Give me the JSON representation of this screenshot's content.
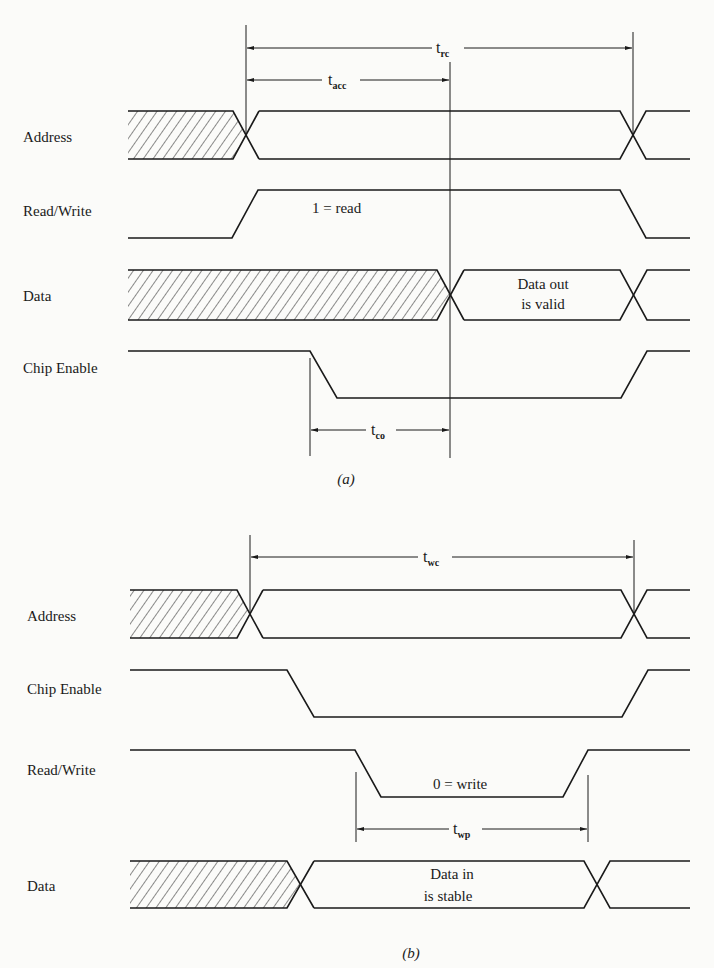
{
  "figure": {
    "part_a": {
      "caption": "(a)",
      "signals": [
        {
          "name": "Address"
        },
        {
          "name": "Read/Write",
          "annotation": "1 = read"
        },
        {
          "name": "Data",
          "annotation_line1": "Data out",
          "annotation_line2": "is valid"
        },
        {
          "name": "Chip Enable"
        }
      ],
      "timings": [
        {
          "id": "t_rc",
          "main": "t",
          "sub": "rc"
        },
        {
          "id": "t_acc",
          "main": "t",
          "sub": "acc"
        },
        {
          "id": "t_co",
          "main": "t",
          "sub": "co"
        }
      ]
    },
    "part_b": {
      "caption": "(b)",
      "signals": [
        {
          "name": "Address"
        },
        {
          "name": "Chip Enable"
        },
        {
          "name": "Read/Write",
          "annotation": "0 = write"
        },
        {
          "name": "Data",
          "annotation_line1": "Data in",
          "annotation_line2": "is stable"
        }
      ],
      "timings": [
        {
          "id": "t_wc",
          "main": "t",
          "sub": "wc"
        },
        {
          "id": "t_wp",
          "main": "t",
          "sub": "wp"
        }
      ]
    },
    "colors": {
      "ink": "#1a1a1a",
      "paper": "#fbfbf9"
    }
  }
}
